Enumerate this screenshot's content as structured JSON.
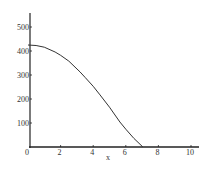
{
  "chart_data": {
    "type": "line",
    "title": "",
    "xlabel": "x",
    "ylabel": "",
    "xlim": [
      0,
      10
    ],
    "ylim": [
      0,
      520
    ],
    "grid": false,
    "legend": null,
    "x_ticks": [
      "0",
      "2",
      "4",
      "6",
      "8",
      "10"
    ],
    "y_ticks": [
      "100",
      "200",
      "300",
      "400",
      "500"
    ],
    "series": [
      {
        "name": "curve",
        "x": [
          0,
          0.5,
          1.0,
          1.66,
          2.0,
          2.5,
          3.19,
          3.5,
          4.0,
          4.42,
          5.0,
          5.64,
          6.0,
          6.5,
          7.05
        ],
        "y": [
          425,
          423,
          416,
          396,
          382,
          358,
          313,
          290,
          253,
          217,
          166,
          104,
          74,
          36,
          0
        ]
      }
    ],
    "colors": {
      "line": "#333333",
      "axis": "#222222"
    }
  }
}
